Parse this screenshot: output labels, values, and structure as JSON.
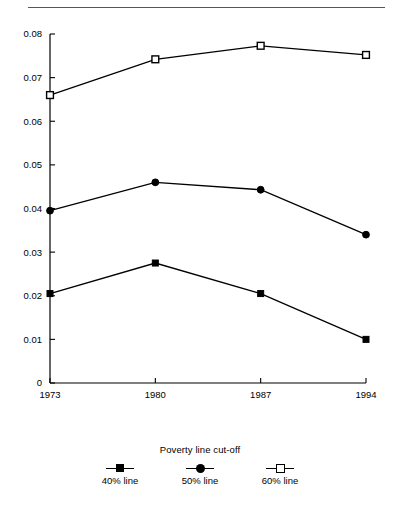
{
  "chart_data": {
    "type": "line",
    "title": "",
    "xlabel": "",
    "ylabel": "",
    "x": [
      1973,
      1980,
      1987,
      1994
    ],
    "categories": [
      "1973",
      "1980",
      "1987",
      "1994"
    ],
    "xtick_labels": [
      "1973",
      "1980",
      "1987",
      "1994"
    ],
    "ytick_labels": [
      "0",
      "0.01",
      "0.02",
      "0.03",
      "0.04",
      "0.05",
      "0.06",
      "0.07",
      "0.08"
    ],
    "ytick_values": [
      0,
      0.01,
      0.02,
      0.03,
      0.04,
      0.05,
      0.06,
      0.07,
      0.08
    ],
    "ylim": [
      0,
      0.08
    ],
    "xlim": [
      1973,
      1994
    ],
    "grid": false,
    "legend_position": "bottom-center",
    "legend_title": "Poverty line cut-off",
    "series": [
      {
        "name": "40% line",
        "marker": "filled-square",
        "values": [
          0.0205,
          0.0275,
          0.0205,
          0.01
        ]
      },
      {
        "name": "50% line",
        "marker": "filled-circle",
        "values": [
          0.0395,
          0.046,
          0.0443,
          0.034
        ]
      },
      {
        "name": "60% line",
        "marker": "open-square",
        "values": [
          0.066,
          0.0742,
          0.0773,
          0.0752
        ]
      }
    ]
  },
  "legend": {
    "title": "Poverty line cut-off",
    "items": [
      {
        "label": "40% line",
        "marker": "filled-square"
      },
      {
        "label": "50% line",
        "marker": "filled-circle"
      },
      {
        "label": "60% line",
        "marker": "open-square"
      }
    ]
  },
  "colors": {
    "line": "#000000",
    "axis": "#000000",
    "rule": "#555555",
    "background": "#ffffff"
  }
}
